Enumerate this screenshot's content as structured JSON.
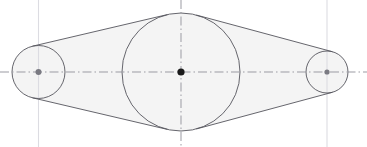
{
  "drawing": {
    "title": "Three-pulley belt envelope",
    "type": "cad-technical-drawing",
    "canvas": {
      "width": 367,
      "height": 147
    },
    "background_color": "#ffffff",
    "fill_color": "#f4f4f4",
    "outline_color": "#55555c",
    "centerline_color": "#9b9ba3",
    "construction_line_color": "#dcdce2",
    "center_marker_color": "#1a1a1a",
    "pulley_marker_color": "#7a7a82",
    "circles": [
      {
        "name": "left-pulley",
        "cx": 38.5,
        "cy": 72,
        "r": 26.5,
        "marker_r": 3.0,
        "marker_color": "#7a7a82",
        "label": "Left pulley"
      },
      {
        "name": "center-pulley",
        "cx": 181,
        "cy": 72,
        "r": 59,
        "marker_r": 3.6,
        "marker_color": "#1a1a1a",
        "label": "Center pulley"
      },
      {
        "name": "right-pulley",
        "cx": 327,
        "cy": 72,
        "r": 21,
        "marker_r": 2.6,
        "marker_color": "#7a7a82",
        "label": "Right pulley"
      }
    ],
    "centerlines": [
      {
        "name": "horizontal-axis",
        "orientation": "horizontal",
        "x1": 0,
        "y1": 72,
        "x2": 367,
        "y2": 72,
        "style": "dash-dot"
      },
      {
        "name": "vertical-center-axis",
        "orientation": "vertical",
        "x1": 181,
        "y1": 0,
        "x2": 181,
        "y2": 147,
        "style": "dash-dot"
      }
    ],
    "construction_lines": [
      {
        "name": "left-vertical-construction",
        "x1": 38.5,
        "y1": 0,
        "x2": 38.5,
        "y2": 147
      },
      {
        "name": "right-vertical-construction",
        "x1": 327,
        "y1": 0,
        "x2": 327,
        "y2": 147
      }
    ],
    "envelope": {
      "name": "belt-envelope",
      "description": "Outer tangent belt wrapping three pulleys",
      "fill": "#f4f4f4",
      "stroke": "#55555c",
      "stroke_width": 0.9
    }
  }
}
